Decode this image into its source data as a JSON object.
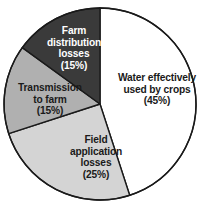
{
  "chart_data": {
    "type": "pie",
    "title": "",
    "subtitle": "",
    "xlabel": "",
    "ylabel": "",
    "legend_position": "none",
    "grid": false,
    "labels_inside_slices": true,
    "start_angle_deg": 0,
    "direction": "clockwise",
    "categories": [
      "Water effectively used by crops",
      "Field application losses",
      "Transmission to farm",
      "Farm distribution losses"
    ],
    "values": [
      45,
      25,
      15,
      15
    ],
    "units": "%",
    "slices": [
      {
        "name": "Water effectively used by crops",
        "value": 45,
        "value_label": "(45%)",
        "label_line1": "Water effectively",
        "label_line2": "used by crops",
        "label_text": "Water effectively\nused by crops\n(45%)",
        "color": "#ffffff",
        "text_color": "#1a1a1a",
        "start_angle_deg": 0,
        "end_angle_deg": 162
      },
      {
        "name": "Field application losses",
        "value": 25,
        "value_label": "(25%)",
        "label_line1": "Field",
        "label_line2": "application",
        "label_line3": "losses",
        "label_text": "Field\napplication\nlosses\n(25%)",
        "color": "#d4d4d4",
        "text_color": "#1a1a1a",
        "start_angle_deg": 162,
        "end_angle_deg": 252
      },
      {
        "name": "Transmission to farm",
        "value": 15,
        "value_label": "(15%)",
        "label_line1": "Transmission",
        "label_line2": "to farm",
        "label_text": "Transmission\nto farm\n(15%)",
        "color": "#b0b0b0",
        "text_color": "#1a1a1a",
        "start_angle_deg": 252,
        "end_angle_deg": 306
      },
      {
        "name": "Farm distribution losses",
        "value": 15,
        "value_label": "(15%)",
        "label_line1": "Farm",
        "label_line2": "distribution",
        "label_line3": "losses",
        "label_text": "Farm\ndistribution\nlosses\n(15%)",
        "color": "#3a3a3a",
        "text_color": "#ffffff",
        "start_angle_deg": 306,
        "end_angle_deg": 360
      }
    ],
    "outline_color": "#1a1a1a",
    "background_color": "#ffffff"
  }
}
